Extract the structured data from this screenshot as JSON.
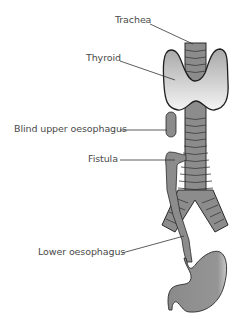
{
  "diagram": {
    "type": "anatomical-illustration",
    "labels": [
      {
        "id": "trachea",
        "text": "Trachea"
      },
      {
        "id": "thyroid",
        "text": "Thyroid"
      },
      {
        "id": "blind-upper-oesophagus",
        "text": "Blind upper oesophagus"
      },
      {
        "id": "fistula",
        "text": "Fistula"
      },
      {
        "id": "lower-oesophagus",
        "text": "Lower oesophagus"
      }
    ],
    "colors": {
      "organ_fill": "#8c8c8c",
      "thyroid_fill_top": "#a8a8a8",
      "thyroid_fill_bottom": "#f2f2f2",
      "outline": "#2a2a2a",
      "leader_line": "#333333",
      "label_text": "#4a4a4a"
    }
  }
}
